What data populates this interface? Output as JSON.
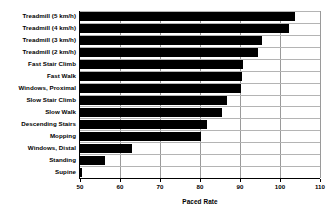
{
  "chart_data": {
    "type": "bar",
    "orientation": "horizontal",
    "title": "",
    "xlabel": "Paced Rate",
    "ylabel": "",
    "xlim": [
      50,
      110
    ],
    "xticks": [
      50,
      60,
      70,
      80,
      90,
      100,
      110
    ],
    "grid": true,
    "legend": null,
    "categories": [
      "Treadmill (5 km/h)",
      "Treadmill (4 km/h)",
      "Treadmill (3 km/h)",
      "Treadmill (2 km/h)",
      "Fast Stair Climb",
      "Fast Walk",
      "Windows, Proximal",
      "Slow Stair Climb",
      "Slow Walk",
      "Descending Stairs",
      "Mopping",
      "Windows, Distal",
      "Standing",
      "Supine"
    ],
    "values": [
      103.7,
      102.2,
      95.5,
      94.5,
      90.8,
      90.5,
      90.2,
      86.8,
      85.5,
      81.8,
      80.2,
      63.0,
      56.2,
      50.3
    ],
    "bar_color": "#000000",
    "grid_color": "#9a9a9a",
    "axis_color": "#000000"
  }
}
